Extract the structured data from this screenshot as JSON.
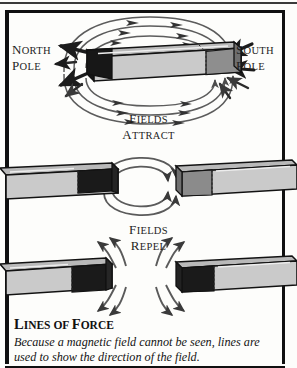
{
  "figure": {
    "title_heading": "LINES OF FORCE",
    "title_heading_parts": {
      "lead": "L",
      "rest1": "INES OF ",
      "lead2": "F",
      "rest2": "ORCE"
    },
    "caption": "Because a magnetic field cannot be seen, lines are used to show the direction of the field.",
    "labels": {
      "north_pole_line1": "NORTH",
      "north_pole_line2": "POLE",
      "south_pole_line1": "SOUTH",
      "south_pole_line2": "POLE",
      "attract_line1": "FIELDS",
      "attract_line2": "ATTRACT",
      "repel_line1": "FIELDS",
      "repel_line2": "REPEL"
    },
    "panels": [
      {
        "id": "single-magnet",
        "description": "Single bar magnet with concentric magnetic field lines looping from north pole to south pole",
        "magnets": 1
      },
      {
        "id": "attracting-pair",
        "description": "Two bar magnets with opposite poles facing, field lines arc across the gap",
        "magnets": 2
      },
      {
        "id": "repelling-pair",
        "description": "Two bar magnets with like poles facing, field lines curve away from the gap",
        "magnets": 2
      }
    ],
    "colors": {
      "page_background": "#fdfdfb",
      "frame": "#101010",
      "magnet_dark_pole": "#141414",
      "magnet_body_light": "#c9c9c9",
      "magnet_body_mid": "#8e8e8e",
      "magnet_top_face": "#b4b4b4",
      "field_line": "#555555",
      "text": "#1a1a1a"
    }
  }
}
